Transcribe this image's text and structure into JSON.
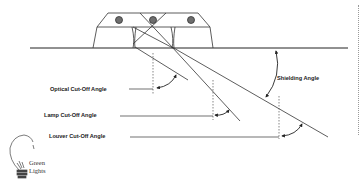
{
  "diagram": {
    "labels": {
      "optical_cutoff": "Optical Cut-Off Angle",
      "lamp_cutoff": "Lamp Cut-Off Angle",
      "louver_cutoff": "Louver Cut-Off Angle",
      "shielding": "Shielding Angle"
    },
    "fixture": {
      "lamp_count": 3
    },
    "colors": {
      "line": "#222222",
      "lamp_fill": "#6e6e6e",
      "dashed": "#555555"
    }
  },
  "logo": {
    "line1": "Green",
    "line2": "Lights",
    "icon": "lightbulb-icon"
  }
}
